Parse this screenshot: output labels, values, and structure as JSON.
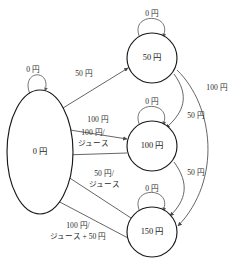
{
  "diagram": {
    "currency_symbol": "円",
    "stroke_color": "#4a4a4a",
    "node_stroke_color": "#1a1a1a",
    "background_color": "#ffffff"
  },
  "states": [
    {
      "id": "s0",
      "label": "0 円",
      "shape": "ellipse",
      "cx": 40,
      "cy": 152,
      "rx": 33,
      "ry": 62
    },
    {
      "id": "s50",
      "label": "50 円",
      "shape": "circle",
      "cx": 152,
      "cy": 58,
      "r": 25
    },
    {
      "id": "s100",
      "label": "100 円",
      "shape": "circle",
      "cx": 152,
      "cy": 146,
      "r": 25
    },
    {
      "id": "s150",
      "label": "150 円",
      "shape": "circle",
      "cx": 152,
      "cy": 232,
      "r": 25
    }
  ],
  "self_loops": [
    {
      "id": "loop-s0",
      "state": "s0",
      "label": "0 円",
      "label_x": 33,
      "label_y": 70
    },
    {
      "id": "loop-s50",
      "state": "s50",
      "label": "0 円",
      "label_x": 152,
      "label_y": 14
    },
    {
      "id": "loop-s100",
      "state": "s100",
      "label": "0 円",
      "label_x": 152,
      "label_y": 102
    },
    {
      "id": "loop-s150",
      "state": "s150",
      "label": "0 円",
      "label_x": 152,
      "label_y": 189
    }
  ],
  "transitions": [
    {
      "id": "t-0-to-50",
      "from": "s0",
      "to": "s50",
      "label_lines": [
        "50 円"
      ],
      "label_x": 84,
      "label_y": 74,
      "input": "50 円",
      "output": ""
    },
    {
      "id": "t-0-to-100",
      "from": "s0",
      "to": "s100",
      "label_lines": [
        "100 円"
      ],
      "label_x": 98,
      "label_y": 120,
      "input": "100 円",
      "output": ""
    },
    {
      "id": "t-100-to-0",
      "from": "s100",
      "to": "s0",
      "label_lines": [
        "100 円/",
        "ジュース"
      ],
      "label_x": 93,
      "label_y": 136,
      "input": "100 円",
      "output": "ジュース"
    },
    {
      "id": "t-150-to-0-juice",
      "from": "s150",
      "to": "s0",
      "label_lines": [
        "50 円/",
        "ジュース"
      ],
      "label_x": 104,
      "label_y": 178,
      "input": "50 円",
      "output": "ジュース"
    },
    {
      "id": "t-150-to-0-change",
      "from": "s150",
      "to": "s0",
      "label_lines": [
        "100 円/",
        "ジュース + 50 円"
      ],
      "label_x": 78,
      "label_y": 230,
      "input": "100 円",
      "output": "ジュース + 50 円"
    },
    {
      "id": "t-50-to-100",
      "from": "s50",
      "to": "s100",
      "label_lines": [
        "50 円"
      ],
      "label_x": 196,
      "label_y": 116,
      "input": "50 円",
      "output": ""
    },
    {
      "id": "t-100-to-150",
      "from": "s100",
      "to": "s150",
      "label_lines": [
        "50 円"
      ],
      "label_x": 196,
      "label_y": 173,
      "input": "50 円",
      "output": ""
    },
    {
      "id": "t-50-to-150",
      "from": "s50",
      "to": "s150",
      "label_lines": [
        "100 円"
      ],
      "label_x": 217,
      "label_y": 88,
      "input": "100 円",
      "output": ""
    }
  ]
}
